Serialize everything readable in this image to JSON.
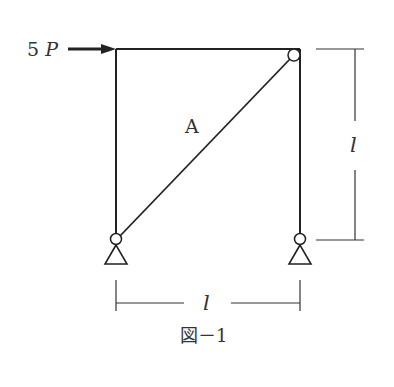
{
  "figure": {
    "load_label": "5 P",
    "load_coef": "5",
    "load_var": "P",
    "member_label": "A",
    "height_label": "l",
    "span_label": "l",
    "caption": "図－1"
  },
  "colors": {
    "line": "#222222",
    "text": "#333333"
  }
}
